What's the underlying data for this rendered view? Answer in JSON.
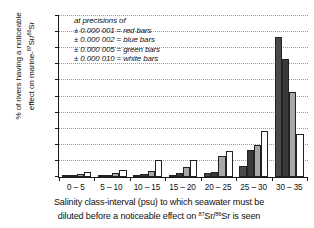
{
  "chart_data": {
    "type": "bar",
    "title": "",
    "xlabel": "Salinity class-interval (psu) to which seawater must be diluted before a noticeable effect on 87Sr/86Sr is seen",
    "ylabel": "% of rivers having a noticeable effect on marine-87Sr/86Sr",
    "categories": [
      "0 – 5",
      "5 – 10",
      "10 – 15",
      "15 – 20",
      "20 – 25",
      "25 – 30",
      "30 – 35"
    ],
    "ylim": [
      0,
      100
    ],
    "yticks": [
      0,
      10,
      20,
      30,
      40,
      50,
      60,
      70,
      80,
      90,
      100
    ],
    "grid": true,
    "legend_position": "inside-top-left",
    "series": [
      {
        "name": "± 0.000 001 = red bars",
        "color": "#4a4a4a",
        "values": [
          0.6,
          0.6,
          1.3,
          1.4,
          2.8,
          7.0,
          87.0
        ]
      },
      {
        "name": "± 0.000 002 = blue bars",
        "color": "#3a3a3a",
        "values": [
          0.9,
          0.9,
          1.7,
          2.2,
          3.2,
          17.0,
          73.0
        ]
      },
      {
        "name": "± 0.000 005 = green bars",
        "color": "#a8a8a8",
        "values": [
          1.8,
          2.4,
          3.7,
          6.3,
          13.2,
          20.0,
          52.5
        ]
      },
      {
        "name": "± 0.000 010 = white bars",
        "color": "#ffffff",
        "values": [
          3.2,
          4.3,
          10.4,
          10.7,
          16.0,
          28.3,
          26.6
        ]
      }
    ]
  },
  "axes": {
    "y_title_line1": "% of rivers having a noticeable",
    "y_title_line2_pre": "effect on marine-",
    "y_title_line2_sup1": "87",
    "y_title_line2_mid": "Sr/",
    "y_title_line2_sup2": "86",
    "y_title_line2_post": "Sr",
    "x_title_line1": "Salinity class-interval (psu) to which seawater must be",
    "x_title_line2_pre": "diluted before a noticeable effect on ",
    "x_title_line2_sup1": "87",
    "x_title_line2_mid": "Sr/",
    "x_title_line2_sup2": "86",
    "x_title_line2_post": "Sr is seen"
  },
  "legend": {
    "heading": "at precisions of",
    "items": [
      "± 0.000 001 = red bars",
      "± 0.000 002 = blue bars",
      "± 0.000 005 = green bars",
      "± 0.000 010 = white bars"
    ]
  }
}
